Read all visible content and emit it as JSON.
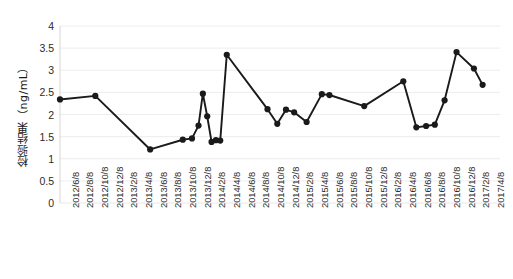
{
  "chart_data": {
    "type": "line",
    "title": "",
    "xlabel": "",
    "ylabel": "检验结果（ng/mL）",
    "ylim": [
      0,
      4
    ],
    "ytick_labels": [
      "0",
      "0.5",
      "1",
      "1.5",
      "2",
      "2.5",
      "3",
      "3.5",
      "4"
    ],
    "ytick_values": [
      0,
      0.5,
      1,
      1.5,
      2,
      2.5,
      3,
      3.5,
      4
    ],
    "grid": true,
    "grid_axis": "y",
    "legend": false,
    "marker": "circle",
    "line_color": "#1a1a1a",
    "marker_color": "#1a1a1a",
    "background_color": "#ffffff",
    "grid_color": "#e8e8e8",
    "categories": [
      "2012/6/8",
      "2012/8/8",
      "2012/10/8",
      "2012/12/8",
      "2013/2/8",
      "2013/4/8",
      "2013/6/8",
      "2013/8/8",
      "2013/10/8",
      "2013/12/8",
      "2014/2/8",
      "2014/4/8",
      "2014/6/8",
      "2014/8/8",
      "2014/10/8",
      "2014/12/8",
      "2015/2/8",
      "2015/4/8",
      "2015/6/8",
      "2015/8/8",
      "2015/10/8",
      "2015/12/8",
      "2016/2/8",
      "2016/4/8",
      "2016/6/8",
      "2016/8/8",
      "2016/10/8",
      "2016/12/8",
      "2017/2/8",
      "2017/4/8"
    ],
    "series": [
      {
        "name": "检验结果",
        "points": [
          {
            "date": "2012/6/8",
            "x": 0.0,
            "y": 2.34
          },
          {
            "date": "2012/9/20",
            "x": 3.25,
            "y": 2.42
          },
          {
            "date": "2013/2/20",
            "x": 8.3,
            "y": 1.21
          },
          {
            "date": "2013/5/25",
            "x": 11.3,
            "y": 1.43
          },
          {
            "date": "2013/6/20",
            "x": 12.15,
            "y": 1.46
          },
          {
            "date": "2013/7/10",
            "x": 12.75,
            "y": 1.75
          },
          {
            "date": "2013/7/25",
            "x": 13.15,
            "y": 2.47
          },
          {
            "date": "2013/8/10",
            "x": 13.55,
            "y": 1.96
          },
          {
            "date": "2013/8/25",
            "x": 13.95,
            "y": 1.38
          },
          {
            "date": "2013/9/10",
            "x": 14.35,
            "y": 1.42
          },
          {
            "date": "2013/9/25",
            "x": 14.75,
            "y": 1.41
          },
          {
            "date": "2013/10/25",
            "x": 15.35,
            "y": 3.35
          },
          {
            "date": "2014/2/20",
            "x": 19.1,
            "y": 2.12
          },
          {
            "date": "2014/4/10",
            "x": 20.0,
            "y": 1.79
          },
          {
            "date": "2014/5/15",
            "x": 20.8,
            "y": 2.11
          },
          {
            "date": "2014/6/20",
            "x": 21.55,
            "y": 2.05
          },
          {
            "date": "2014/8/20",
            "x": 22.7,
            "y": 1.83
          },
          {
            "date": "2014/11/10",
            "x": 24.1,
            "y": 2.46
          },
          {
            "date": "2014/12/20",
            "x": 24.8,
            "y": 2.44
          },
          {
            "date": "2015/6/8",
            "x": 28.0,
            "y": 2.19
          },
          {
            "date": "2015/12/20",
            "x": 31.6,
            "y": 2.75
          },
          {
            "date": "2016/2/20",
            "x": 32.8,
            "y": 1.71
          },
          {
            "date": "2016/4/10",
            "x": 33.7,
            "y": 1.74
          },
          {
            "date": "2016/5/20",
            "x": 34.5,
            "y": 1.77
          },
          {
            "date": "2016/7/10",
            "x": 35.4,
            "y": 2.32
          },
          {
            "date": "2016/9/10",
            "x": 36.5,
            "y": 3.41
          },
          {
            "date": "2016/12/8",
            "x": 38.1,
            "y": 3.04
          },
          {
            "date": "2017/1/20",
            "x": 38.9,
            "y": 2.67
          }
        ]
      }
    ]
  },
  "layout": {
    "plot_left": 60,
    "plot_right": 500,
    "plot_top": 26,
    "plot_bottom": 203,
    "x_units": 40.5
  }
}
